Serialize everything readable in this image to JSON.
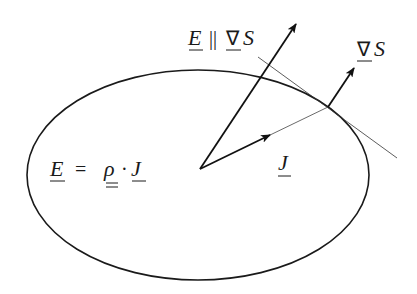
{
  "diagram": {
    "region": {
      "shape": "ellipse",
      "cx": 198,
      "cy": 175,
      "rx": 171,
      "ry": 105
    },
    "origin": {
      "x": 200,
      "y": 169
    },
    "vectors": {
      "E": {
        "to": {
          "x": 296,
          "y": 24
        }
      },
      "J": {
        "to": {
          "x": 270,
          "y": 135
        },
        "extension_to": {
          "x": 328,
          "y": 107
        }
      },
      "gradS": {
        "from": {
          "x": 328,
          "y": 107
        },
        "to": {
          "x": 354,
          "y": 68
        }
      }
    },
    "tangent_line": {
      "from": {
        "x": 258,
        "y": 57
      },
      "to": {
        "x": 397,
        "y": 158
      }
    },
    "labels": {
      "constitutive": {
        "E": "E",
        "eq": "=",
        "rho": "ρ",
        "dot": "·",
        "J": "J"
      },
      "parallel": {
        "E": "E",
        "par": "||",
        "nabla": "∇",
        "S": "S"
      },
      "gradS": {
        "nabla": "∇",
        "S": "S"
      },
      "J": "J"
    }
  }
}
